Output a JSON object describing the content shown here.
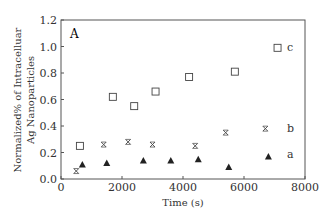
{
  "chart_data": {
    "type": "scatter",
    "title": "",
    "panel_label": "A",
    "xlabel": "Time (s)",
    "ylabel": [
      "Normalized% of Intracelluar",
      "Ag Nanoparticles"
    ],
    "xlim": [
      0,
      8000
    ],
    "ylim": [
      0.0,
      1.2
    ],
    "xticks": [
      "0",
      "2000",
      "4000",
      "6000",
      "8000"
    ],
    "yticks": [
      "0.0",
      "0.2",
      "0.4",
      "0.6",
      "0.8",
      "1.0",
      "1.2"
    ],
    "grid": false,
    "legend": "inline labels at right",
    "series": [
      {
        "name": "a",
        "marker": "filled-triangle",
        "x": [
          700,
          1500,
          2700,
          3600,
          4500,
          5500,
          6800
        ],
        "y": [
          0.11,
          0.12,
          0.14,
          0.14,
          0.15,
          0.09,
          0.17
        ]
      },
      {
        "name": "b",
        "marker": "asterisk",
        "x": [
          500,
          1400,
          2200,
          3000,
          4400,
          5400,
          6700
        ],
        "y": [
          0.06,
          0.26,
          0.28,
          0.26,
          0.25,
          0.35,
          0.38
        ]
      },
      {
        "name": "c",
        "marker": "open-square",
        "x": [
          620,
          1700,
          2400,
          3100,
          4200,
          5700,
          7100
        ],
        "y": [
          0.25,
          0.62,
          0.55,
          0.66,
          0.77,
          0.81,
          0.99
        ]
      }
    ]
  }
}
